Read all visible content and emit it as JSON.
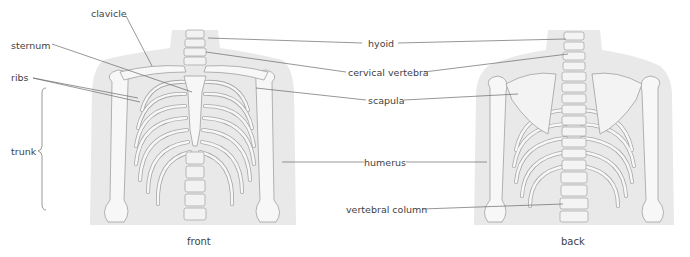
{
  "diagram": {
    "views": {
      "front": {
        "caption": "front"
      },
      "back": {
        "caption": "back"
      }
    },
    "labels": {
      "clavicle": "clavicle",
      "sternum": "sternum",
      "ribs": "ribs",
      "trunk": "trunk",
      "hyoid": "hyoid",
      "cervical_vertebra": "cervical vertebra",
      "scapula": "scapula",
      "humerus": "humerus",
      "vertebral_column": "vertebral column"
    },
    "colors": {
      "body_silhouette": "#e9e9e9",
      "bone_fill": "#f7f7f7",
      "bone_outline": "#9a9a9a",
      "leader_line": "#6a6a6a",
      "text": "#3f3f3f"
    }
  }
}
